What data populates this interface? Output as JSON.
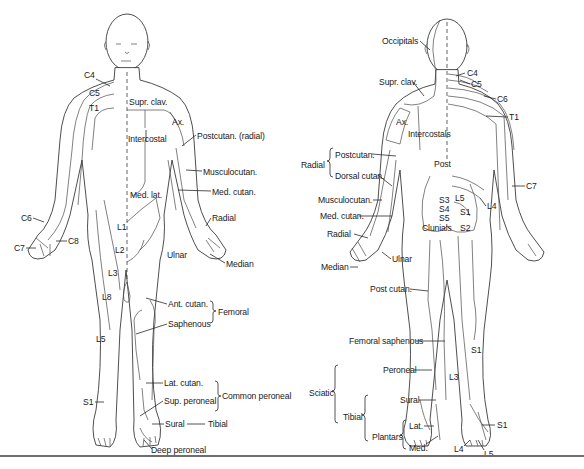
{
  "figure": {
    "type": "cutaneous nerve and dermatome map",
    "views": [
      "anterior",
      "posterior"
    ]
  },
  "anterior": {
    "labels": [
      {
        "id": "c4",
        "text": "C4",
        "x": 84,
        "y": 75
      },
      {
        "id": "c5",
        "text": "C5",
        "x": 89,
        "y": 93
      },
      {
        "id": "t1",
        "text": "T1",
        "x": 89,
        "y": 108
      },
      {
        "id": "supr-clav",
        "text": "Supr. clav.",
        "x": 129,
        "y": 97
      },
      {
        "id": "ax",
        "text": "Ax.",
        "x": 172,
        "y": 117
      },
      {
        "id": "postcutan-radial",
        "text": "Postcutan. (radial)",
        "x": 197,
        "y": 131
      },
      {
        "id": "intercostal",
        "text": "Intercostal",
        "x": 128,
        "y": 134
      },
      {
        "id": "musculocutan",
        "text": "Musculocutan.",
        "x": 203,
        "y": 167
      },
      {
        "id": "med-cutan",
        "text": "Med. cutan.",
        "x": 212,
        "y": 187
      },
      {
        "id": "med-lat",
        "text": "Med. lat.",
        "x": 130,
        "y": 190
      },
      {
        "id": "c6",
        "text": "C6",
        "x": 21,
        "y": 214
      },
      {
        "id": "radial",
        "text": "Radial",
        "x": 212,
        "y": 214
      },
      {
        "id": "l1",
        "text": "L1",
        "x": 117,
        "y": 222
      },
      {
        "id": "c8",
        "text": "C8",
        "x": 68,
        "y": 237
      },
      {
        "id": "c7",
        "text": "C7",
        "x": 14,
        "y": 244
      },
      {
        "id": "l2",
        "text": "L2",
        "x": 115,
        "y": 245
      },
      {
        "id": "ulnar",
        "text": "Ulnar",
        "x": 167,
        "y": 250
      },
      {
        "id": "median",
        "text": "Median",
        "x": 226,
        "y": 259
      },
      {
        "id": "l3",
        "text": "L3",
        "x": 108,
        "y": 268
      },
      {
        "id": "l8",
        "text": "L8",
        "x": 102,
        "y": 292
      },
      {
        "id": "ant-cutan",
        "text": "Ant. cutan.",
        "x": 168,
        "y": 300
      },
      {
        "id": "femoral",
        "text": "Femoral",
        "x": 217,
        "y": 310
      },
      {
        "id": "saphenous",
        "text": "Saphenous",
        "x": 168,
        "y": 320
      },
      {
        "id": "l5",
        "text": "L5",
        "x": 96,
        "y": 334
      },
      {
        "id": "lat-cutan",
        "text": "Lat. cutan.",
        "x": 164,
        "y": 379
      },
      {
        "id": "common-peroneal",
        "text": "Common peroneal",
        "x": 222,
        "y": 394
      },
      {
        "id": "s1",
        "text": "S1",
        "x": 83,
        "y": 398
      },
      {
        "id": "sup-peroneal",
        "text": "Sup. peroneal",
        "x": 164,
        "y": 397
      },
      {
        "id": "sural",
        "text": "Sural",
        "x": 165,
        "y": 420
      },
      {
        "id": "tibial",
        "text": "Tibial",
        "x": 208,
        "y": 420
      },
      {
        "id": "deep-peroneal",
        "text": "Deep peroneal",
        "x": 151,
        "y": 446
      }
    ],
    "groups": [
      {
        "name": "Femoral",
        "members": [
          "Ant. cutan.",
          "Saphenous"
        ]
      },
      {
        "name": "Common peroneal",
        "members": [
          "Lat. cutan.",
          "Sup. peroneal"
        ]
      },
      {
        "name": "Tibial",
        "members": [
          "Sural"
        ]
      }
    ]
  },
  "posterior": {
    "labels": [
      {
        "id": "occipitals",
        "text": "Occipitals",
        "x": 382,
        "y": 37
      },
      {
        "id": "c4",
        "text": "C4",
        "x": 467,
        "y": 69
      },
      {
        "id": "supr-clav",
        "text": "Supr. clav.",
        "x": 379,
        "y": 78
      },
      {
        "id": "c5",
        "text": "C5",
        "x": 471,
        "y": 80
      },
      {
        "id": "c6",
        "text": "C6",
        "x": 497,
        "y": 95
      },
      {
        "id": "t1",
        "text": "T1",
        "x": 509,
        "y": 113
      },
      {
        "id": "ax",
        "text": "Ax.",
        "x": 396,
        "y": 117
      },
      {
        "id": "intercostals",
        "text": "Intercostals",
        "x": 408,
        "y": 130
      },
      {
        "id": "postcutan",
        "text": "Postcutan.",
        "x": 335,
        "y": 150
      },
      {
        "id": "radial-group",
        "text": "Radial",
        "x": 301,
        "y": 161
      },
      {
        "id": "post",
        "text": "Post",
        "x": 434,
        "y": 160
      },
      {
        "id": "dorsal-cutan",
        "text": "Dorsal cutan.",
        "x": 335,
        "y": 172
      },
      {
        "id": "c7",
        "text": "C7",
        "x": 526,
        "y": 182
      },
      {
        "id": "musculocutan",
        "text": "Musculocutan.",
        "x": 318,
        "y": 196
      },
      {
        "id": "s3",
        "text": "S3",
        "x": 439,
        "y": 196
      },
      {
        "id": "l5",
        "text": "L5",
        "x": 455,
        "y": 194
      },
      {
        "id": "l4",
        "text": "L4",
        "x": 487,
        "y": 202
      },
      {
        "id": "s4",
        "text": "S4",
        "x": 439,
        "y": 205
      },
      {
        "id": "s1-upper",
        "text": "S1",
        "x": 460,
        "y": 208
      },
      {
        "id": "med-cutan",
        "text": "Med. cutan.",
        "x": 320,
        "y": 212
      },
      {
        "id": "s5",
        "text": "S5",
        "x": 439,
        "y": 214
      },
      {
        "id": "clunials",
        "text": "Clunials",
        "x": 422,
        "y": 224
      },
      {
        "id": "s2",
        "text": "S2",
        "x": 460,
        "y": 224
      },
      {
        "id": "radial",
        "text": "Radial",
        "x": 327,
        "y": 230
      },
      {
        "id": "ulnar",
        "text": "Ulnar",
        "x": 392,
        "y": 255
      },
      {
        "id": "median",
        "text": "Median",
        "x": 321,
        "y": 263
      },
      {
        "id": "post-cutan",
        "text": "Post cutan.",
        "x": 370,
        "y": 285
      },
      {
        "id": "femoral-saphenous",
        "text": "Femoral saphenous",
        "x": 349,
        "y": 337
      },
      {
        "id": "s1-leg",
        "text": "S1",
        "x": 471,
        "y": 346
      },
      {
        "id": "peroneal",
        "text": "Peroneal",
        "x": 383,
        "y": 366
      },
      {
        "id": "l3",
        "text": "L3",
        "x": 449,
        "y": 373
      },
      {
        "id": "sciatic",
        "text": "Sciatic",
        "x": 309,
        "y": 389
      },
      {
        "id": "sural",
        "text": "Sural",
        "x": 400,
        "y": 396
      },
      {
        "id": "tibial",
        "text": "Tibial",
        "x": 343,
        "y": 413
      },
      {
        "id": "lat",
        "text": "Lat.",
        "x": 409,
        "y": 422
      },
      {
        "id": "s1-foot",
        "text": "S1",
        "x": 497,
        "y": 421
      },
      {
        "id": "plantars",
        "text": "Plantars",
        "x": 372,
        "y": 433
      },
      {
        "id": "med",
        "text": "Med.",
        "x": 409,
        "y": 444
      },
      {
        "id": "l4-foot",
        "text": "L4",
        "x": 454,
        "y": 445
      },
      {
        "id": "l5-foot",
        "text": "L5",
        "x": 484,
        "y": 450
      }
    ],
    "groups": [
      {
        "name": "Radial",
        "members": [
          "Postcutan.",
          "Dorsal cutan."
        ]
      },
      {
        "name": "Sciatic",
        "members": [
          "Peroneal",
          "Sural",
          "Tibial"
        ]
      },
      {
        "name": "Tibial",
        "members": [
          "Sural",
          "Plantars"
        ]
      },
      {
        "name": "Plantars",
        "members": [
          "Lat.",
          "Med."
        ]
      }
    ]
  }
}
